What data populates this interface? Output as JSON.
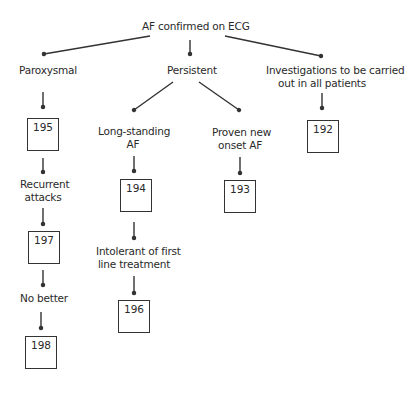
{
  "root": {
    "label": "AF confirmed on ECG"
  },
  "branches": {
    "paroxysmal": {
      "label": "Paroxysmal"
    },
    "persistent": {
      "label": "Persistent"
    },
    "investigations": {
      "label_line1": "Investigations to be carried",
      "label_line2": "out in all patients"
    }
  },
  "nodes": {
    "long_standing": {
      "label_line1": "Long-standing",
      "label_line2": "AF"
    },
    "proven_new": {
      "label_line1": "Proven new",
      "label_line2": "onset AF"
    },
    "recurrent": {
      "label_line1": "Recurrent",
      "label_line2": "attacks"
    },
    "intolerant": {
      "label_line1": "Intolerant of first",
      "label_line2": "line treatment"
    },
    "no_better": {
      "label": "No better"
    }
  },
  "boxes": {
    "b192": "192",
    "b193": "193",
    "b194": "194",
    "b195": "195",
    "b196": "196",
    "b197": "197",
    "b198": "198"
  },
  "colors": {
    "stroke": "#333333",
    "text": "#2a2a2a",
    "background": "#ffffff"
  }
}
